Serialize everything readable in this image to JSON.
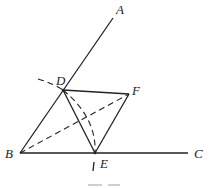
{
  "diagram": {
    "type": "geometry-construction",
    "points": {
      "A": {
        "label": "A",
        "x": 113,
        "y": 18,
        "label_x": 116,
        "label_y": 14
      },
      "B": {
        "label": "B",
        "x": 20,
        "y": 153,
        "label_x": 6,
        "label_y": 158
      },
      "C": {
        "label": "C",
        "x": 188,
        "y": 153,
        "label_x": 194,
        "label_y": 158
      },
      "D": {
        "label": "D",
        "x": 63,
        "y": 90,
        "label_x": 56,
        "label_y": 85
      },
      "E": {
        "label": "E",
        "x": 95,
        "y": 153,
        "label_x": 101,
        "label_y": 167
      },
      "F": {
        "label": "F",
        "x": 129,
        "y": 94,
        "label_x": 132,
        "label_y": 95
      }
    },
    "solid_segments": [
      [
        "B",
        "A"
      ],
      [
        "B",
        "C"
      ],
      [
        "D",
        "F"
      ],
      [
        "D",
        "E"
      ],
      [
        "F",
        "E"
      ]
    ],
    "dashed_segments": [
      [
        "B",
        "F"
      ]
    ],
    "arcs": [
      {
        "name": "construction-arc-through-D",
        "style": "dashed"
      },
      {
        "name": "construction-arc-D-to-E",
        "style": "dashed"
      },
      {
        "name": "construction-tick-below-E",
        "style": "solid"
      }
    ],
    "colors": {
      "stroke": "#222222",
      "background": "#ffffff"
    }
  },
  "caption": {
    "visible": "partially cut off, illegible"
  }
}
